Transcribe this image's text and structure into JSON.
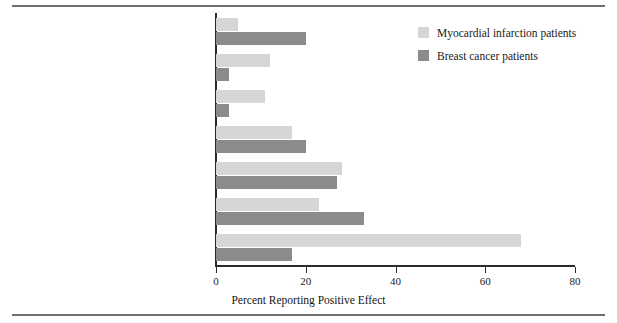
{
  "figure": {
    "ghost_top_text": "",
    "ghost_left_lines": [
      "",
      "",
      "",
      "",
      "",
      "",
      "",
      "",
      "",
      "",
      "",
      "",
      "",
      ""
    ]
  },
  "legend": {
    "position": "top-right",
    "items": [
      {
        "label": "Myocardial infarction patients",
        "color": "#d6d6d6",
        "swatch": "light-gray-swatch"
      },
      {
        "label": "Breast cancer patients",
        "color": "#8b8b8b",
        "swatch": "dark-gray-swatch"
      }
    ]
  },
  "axis": {
    "x_title": "Percent Reporting Positive Effect",
    "x_ticks": [
      "0",
      "20",
      "40",
      "60",
      "80"
    ],
    "x_min": 0,
    "x_max": 80
  },
  "chart_data": {
    "type": "bar",
    "orientation": "horizontal",
    "title": "",
    "subtitle": "",
    "xlabel": "Percent Reporting Positive Effect",
    "ylabel": "",
    "xlim": [
      0,
      80
    ],
    "grid": false,
    "legend_position": "top right",
    "categories": [
      "Improved empathy",
      "Greater knowledge about health",
      "A second chance",
      "A change in personal life priorities",
      "Greater appreciation of health and life",
      "Improved close relationships",
      "Healthy lifestyle change"
    ],
    "series": [
      {
        "name": "Myocardial infarction patients",
        "color": "#d6d6d6",
        "values": [
          5,
          12,
          11,
          17,
          28,
          23,
          68
        ]
      },
      {
        "name": "Breast cancer patients",
        "color": "#8b8b8b",
        "values": [
          20,
          3,
          3,
          20,
          27,
          33,
          17
        ]
      }
    ],
    "xticks": [
      0,
      20,
      40,
      60,
      80
    ]
  }
}
